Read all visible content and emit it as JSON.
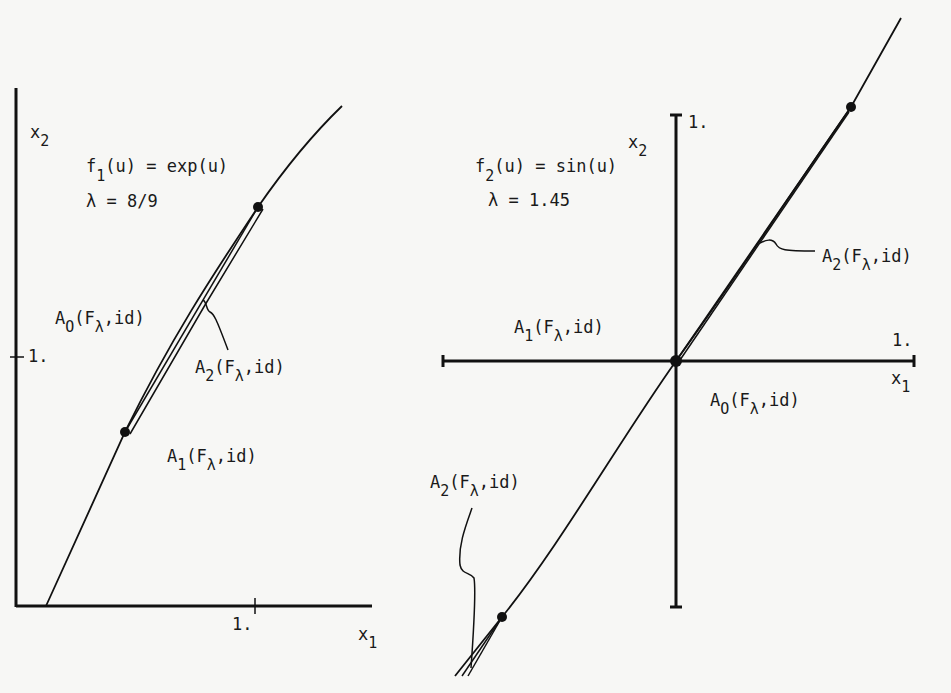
{
  "left_panel": {
    "function_label": {
      "f": "f",
      "sub": "1",
      "rest": "(u) = exp(u)"
    },
    "lambda_label": "λ = 8/9",
    "y_axis_label": {
      "x": "x",
      "sub": "2"
    },
    "x_axis_label": {
      "x": "x",
      "sub": "1"
    },
    "x_tick_label": "1.",
    "y_tick_label": "1.",
    "region_labels": [
      {
        "A": "A",
        "sub": "O",
        "mid": "(F",
        "lam": "λ",
        "end": ",id)"
      },
      {
        "A": "A",
        "sub": "2",
        "mid": "(F",
        "lam": "λ",
        "end": ",id)"
      },
      {
        "A": "A",
        "sub": "1",
        "mid": "(F",
        "lam": "λ",
        "end": ",id)"
      }
    ]
  },
  "right_panel": {
    "function_label": {
      "f": "f",
      "sub": "2",
      "rest": "(u) = sin(u)"
    },
    "lambda_label": "λ = 1.45",
    "y_axis_label": {
      "x": "x",
      "sub": "2"
    },
    "x_axis_label": {
      "x": "x",
      "sub": "1"
    },
    "x_tick_label": "1.",
    "y_tick_label": "1.",
    "region_labels": [
      {
        "A": "A",
        "sub": "2",
        "mid": "(F",
        "lam": "λ",
        "end": ",id)"
      },
      {
        "A": "A",
        "sub": "1",
        "mid": "(F",
        "lam": "λ",
        "end": ",id)"
      },
      {
        "A": "A",
        "sub": "O",
        "mid": "(F",
        "lam": "λ",
        "end": ",id)"
      },
      {
        "A": "A",
        "sub": "2",
        "mid": "(F",
        "lam": "λ",
        "end": ",id)"
      }
    ]
  },
  "colors": {
    "ink": "#111111",
    "paper": "#f7f7f5"
  }
}
